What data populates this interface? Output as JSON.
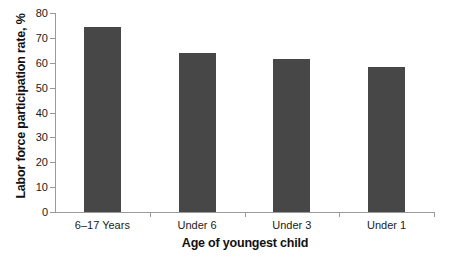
{
  "chart_data": {
    "type": "bar",
    "title": "",
    "subtitle": "",
    "categories": [
      "6–17 Years",
      "Under 6",
      "Under 3",
      "Under 1"
    ],
    "values": [
      74.5,
      64.0,
      61.5,
      58.3
    ],
    "series": [
      {
        "name": "Labor force participation rate",
        "values": [
          74.5,
          64.0,
          61.5,
          58.3
        ]
      }
    ],
    "xlabel": "Age of youngest child",
    "ylabel": "Labor force participation rate, %",
    "ylim": [
      0,
      80
    ],
    "yticks": [
      0,
      10,
      20,
      30,
      40,
      50,
      60,
      70,
      80
    ],
    "ytick_labels": [
      "0",
      "10",
      "20",
      "30",
      "40",
      "50",
      "60",
      "70",
      "80"
    ],
    "xtick_labels": [
      "6–17 Years",
      "Under 6",
      "Under 3",
      "Under 1"
    ],
    "grid": false,
    "legend": false,
    "legend_position": "none",
    "bar_color": "#474747",
    "axis_color": "#9a9a9a",
    "background_color": "#ffffff",
    "annotations": []
  }
}
